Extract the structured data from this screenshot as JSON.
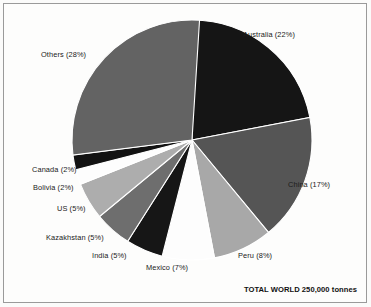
{
  "chart_data": {
    "type": "pie",
    "title": "",
    "subtitle": "",
    "annotation": "TOTAL WORLD 250,000 tonnes",
    "legend_position": "none",
    "labels_on_slices": true,
    "unit": "tonnes",
    "total": "250,000",
    "categories": [
      "Australia",
      "China",
      "Peru",
      "Mexico",
      "India",
      "Kazakhstan",
      "US",
      "Bolivia",
      "Canada",
      "Others"
    ],
    "values": [
      22,
      17,
      8,
      7,
      5,
      5,
      5,
      2,
      2,
      28
    ],
    "slices": [
      {
        "name": "Australia",
        "value": 22,
        "label": "Australia (22%)",
        "color": "#151515",
        "start_deg": 0,
        "end_deg": 79.2
      },
      {
        "name": "China",
        "value": 17,
        "label": "China (17%)",
        "color": "#555555",
        "start_deg": 79.2,
        "end_deg": 140.4
      },
      {
        "name": "Peru",
        "value": 8,
        "label": "Peru (8%)",
        "color": "#a8a8a8",
        "start_deg": 140.4,
        "end_deg": 169.2
      },
      {
        "name": "Mexico",
        "value": 7,
        "label": "Mexico (7%)",
        "color": "#fdfdfd",
        "start_deg": 169.2,
        "end_deg": 194.4
      },
      {
        "name": "India",
        "value": 5,
        "label": "India (5%)",
        "color": "#161616",
        "start_deg": 194.4,
        "end_deg": 212.4
      },
      {
        "name": "Kazakhstan",
        "value": 5,
        "label": "Kazakhstan (5%)",
        "color": "#6e6e6e",
        "start_deg": 212.4,
        "end_deg": 230.4
      },
      {
        "name": "US",
        "value": 5,
        "label": "US (5%)",
        "color": "#adadad",
        "start_deg": 230.4,
        "end_deg": 248.4
      },
      {
        "name": "Bolivia",
        "value": 2,
        "label": "Bolivia (2%)",
        "color": "#fdfdfd",
        "start_deg": 248.4,
        "end_deg": 255.6
      },
      {
        "name": "Canada",
        "value": 2,
        "label": "Canada (2%)",
        "color": "#121212",
        "start_deg": 255.6,
        "end_deg": 262.8
      },
      {
        "name": "Others",
        "value": 28,
        "label": "Others (28%)",
        "color": "#636363",
        "start_deg": 262.8,
        "end_deg": 363.6
      }
    ],
    "geometry": {
      "center_x": 192,
      "center_y": 140,
      "radius": 120
    }
  }
}
